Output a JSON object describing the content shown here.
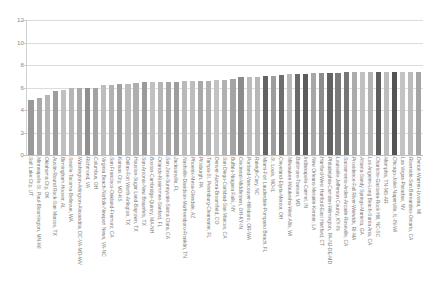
{
  "chart_data": {
    "type": "bar",
    "title": "",
    "subtitle": "",
    "xlabel": "",
    "ylabel": "",
    "ylim": [
      0,
      12
    ],
    "y_ticks": [
      0,
      2,
      4,
      6,
      8,
      10,
      12
    ],
    "grid": "horizontal",
    "legend": "none",
    "orientation": "vertical",
    "bar_color_default": "#b0b0b0",
    "x_label_rotation": 90,
    "categories": [
      "Salt Lake City, UT",
      "Minneapolis-St. Paul-Bloomington, MN-WI",
      "Oklahoma City, OK",
      "Austin-Round Rock-San Marcos, TX",
      "Birmingham-Hoover, AL",
      "Seattle-Tacoma-Bellevue, WA",
      "Washington-Arlington-Alexandria, DC-VA-MD-WV",
      "Richmond, VA",
      "Columbus, OH",
      "Virginia Beach-Norfolk-Newport News, VA-NC",
      "San Francisco-Oakland-Fremont, CA",
      "Kansas City, MO-KS",
      "Dallas-Fort Worth-Arlington, TX",
      "Houston-Sugar Land-Baytown, TX",
      "San Antonio-New Braunfels, TX",
      "Boston-Cambridge-Quincy, MA-NH",
      "Orlando-Kissimmee-Sanford, FL",
      "San Jose-Sunnyvale-Santa Clara, CA",
      "Jacksonville, FL",
      "Nashville-Davidson-Murfreesboro-Franklin, TN",
      "Phoenix-Mesa-Glendale, AZ",
      "Pittsburgh, PA",
      "Tampa-St. Petersburg-Clearwater, FL",
      "Denver-Aurora-Broomfield, CO",
      "San Diego-Carlsbad-San Marcos, CA",
      "Buffalo-Niagara Falls, NY",
      "Cincinnati-Middletown, OH-KY-IN",
      "Portland-Vancouver-Hillsboro, OR-WA",
      "Raleigh-Cary, NC",
      "Miami-Fort Lauderdale-Pompano Beach, FL",
      "St. Louis, MO-IL",
      "Cleveland-Elyria-Mentor, OH",
      "Milwaukee-Waukesha-West Allis, WI",
      "Baltimore-Towson, MD",
      "Indianapolis-Carmel, IN",
      "New Orleans-Metairie-Kenner, LA",
      "Hartford-West Hartford-East Hartford, CT",
      "Philadelphia-Camden-Wilmington, PA-NJ-DE-MD",
      "Louisville-Jefferson County, KY-IN",
      "Sacramento-Arden-Arcade-Roseville, CA",
      "Providence-Fall River-Warwick, RI-MA",
      "Atlanta-Sandy Springs-Marietta, GA",
      "Los Angeles-Long Beach-Santa Ana, CA",
      "Charlotte-Gastonia-Rock Hill, NC-SC",
      "Memphis, TN-MS-AR",
      "Chicago-Joliet-Naperville, IL-IN-WI",
      "Las Vegas-Paradise, NV",
      "Riverside-San Bernardino-Ontario, CA",
      "Detroit-Warren-Livonia, MI"
    ],
    "values": [
      4.9,
      5.1,
      5.35,
      5.7,
      5.75,
      5.95,
      5.95,
      5.95,
      6.0,
      6.2,
      6.25,
      6.3,
      6.3,
      6.4,
      6.45,
      6.5,
      6.5,
      6.5,
      6.5,
      6.55,
      6.6,
      6.6,
      6.6,
      6.7,
      6.7,
      6.75,
      6.9,
      6.9,
      6.9,
      7.0,
      7.0,
      7.15,
      7.2,
      7.2,
      7.2,
      7.25,
      7.25,
      7.25,
      7.3,
      7.35,
      7.35,
      7.35,
      7.35,
      7.35,
      7.4,
      7.4,
      7.4,
      7.4,
      7.35
    ],
    "bar_colors": [
      "#9a9a9a",
      "#a9a9a9",
      "#b4b4b4",
      "#9d9d9d",
      "#c0c0c0",
      "#b6b6b6",
      "#aaaaaa",
      "#8f8f8f",
      "#a3a3a3",
      "#bdbdbd",
      "#b2b2b2",
      "#a0a0a0",
      "#bcbcbc",
      "#aeaeae",
      "#9b9b9b",
      "#c1c1c1",
      "#b5b5b5",
      "#a6a6a6",
      "#9d9d9d",
      "#b9b9b9",
      "#bdbdbd",
      "#a8a8a8",
      "#b0b0b0",
      "#c2c2c2",
      "#b1b1b1",
      "#a4a4a4",
      "#8b8b8b",
      "#bbbbbb",
      "#b7b7b7",
      "#636363",
      "#9e9e9e",
      "#6e6e6e",
      "#b9b9b9",
      "#6a6a6a",
      "#5c5c5c",
      "#a7a7a7",
      "#8d8d8d",
      "#626262",
      "#7a7a7a",
      "#757575",
      "#ababab",
      "#c0c0c0",
      "#b3b3b3",
      "#5f5f5f",
      "#bdbdbd",
      "#545454",
      "#c3c3c3",
      "#bcbcbc",
      "#a5a5a5"
    ]
  }
}
